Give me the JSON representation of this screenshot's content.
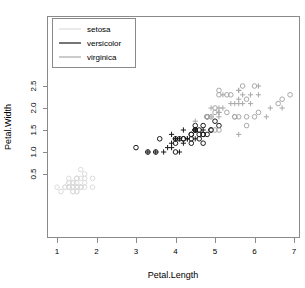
{
  "chart_data": {
    "type": "scatter",
    "title": "",
    "xlabel": "Petal.Length",
    "ylabel": "Petal.Width",
    "xlim": [
      0.8,
      7.05
    ],
    "ylim": [
      0.05,
      2.6
    ],
    "xticks": [
      1,
      2,
      3,
      4,
      5,
      6,
      7
    ],
    "yticks": [
      0.5,
      1.0,
      1.5,
      2.0,
      2.5
    ],
    "xticklabels": [
      "1",
      "2",
      "3",
      "4",
      "5",
      "6",
      "7"
    ],
    "yticklabels": [
      "0.5",
      "1.0",
      "1.5",
      "2.0",
      "2.5"
    ],
    "grid": false,
    "legend_position": "top-left",
    "legend": [
      {
        "label": "setosa",
        "color": "#d9d9d9",
        "marker": "circle"
      },
      {
        "label": "versicolor",
        "color": "#1a1a1a",
        "marker": "circle"
      },
      {
        "label": "virginica",
        "color": "#a8a8a8",
        "marker": "circle"
      }
    ],
    "series": [
      {
        "name": "setosa",
        "color": "#dcdcdc",
        "marker": "circle",
        "points": [
          [
            1.4,
            0.2
          ],
          [
            1.4,
            0.2
          ],
          [
            1.3,
            0.2
          ],
          [
            1.5,
            0.2
          ],
          [
            1.4,
            0.2
          ],
          [
            1.7,
            0.4
          ],
          [
            1.4,
            0.3
          ],
          [
            1.5,
            0.2
          ],
          [
            1.4,
            0.2
          ],
          [
            1.5,
            0.1
          ],
          [
            1.5,
            0.2
          ],
          [
            1.6,
            0.2
          ],
          [
            1.4,
            0.1
          ],
          [
            1.1,
            0.1
          ],
          [
            1.2,
            0.2
          ],
          [
            1.5,
            0.4
          ],
          [
            1.3,
            0.4
          ],
          [
            1.4,
            0.3
          ],
          [
            1.7,
            0.3
          ],
          [
            1.5,
            0.3
          ],
          [
            1.7,
            0.2
          ],
          [
            1.5,
            0.4
          ],
          [
            1.0,
            0.2
          ],
          [
            1.7,
            0.5
          ],
          [
            1.9,
            0.2
          ],
          [
            1.6,
            0.2
          ],
          [
            1.6,
            0.4
          ],
          [
            1.5,
            0.2
          ],
          [
            1.4,
            0.2
          ],
          [
            1.6,
            0.2
          ],
          [
            1.6,
            0.2
          ],
          [
            1.5,
            0.4
          ],
          [
            1.5,
            0.1
          ],
          [
            1.4,
            0.2
          ],
          [
            1.5,
            0.2
          ],
          [
            1.2,
            0.2
          ],
          [
            1.3,
            0.2
          ],
          [
            1.4,
            0.1
          ],
          [
            1.3,
            0.2
          ],
          [
            1.5,
            0.2
          ],
          [
            1.3,
            0.3
          ],
          [
            1.3,
            0.3
          ],
          [
            1.3,
            0.2
          ],
          [
            1.6,
            0.6
          ],
          [
            1.9,
            0.4
          ],
          [
            1.4,
            0.3
          ],
          [
            1.6,
            0.2
          ],
          [
            1.4,
            0.2
          ],
          [
            1.5,
            0.2
          ],
          [
            1.4,
            0.2
          ]
        ]
      },
      {
        "name": "versicolor",
        "color": "#1a1a1a",
        "marker": "mixed",
        "points": [
          [
            4.7,
            1.4
          ],
          [
            4.5,
            1.5
          ],
          [
            4.9,
            1.5
          ],
          [
            4.0,
            1.3
          ],
          [
            4.6,
            1.5
          ],
          [
            4.5,
            1.3
          ],
          [
            4.7,
            1.6
          ],
          [
            3.3,
            1.0
          ],
          [
            4.6,
            1.3
          ],
          [
            3.9,
            1.4
          ],
          [
            3.5,
            1.0
          ],
          [
            4.2,
            1.5
          ],
          [
            4.0,
            1.0
          ],
          [
            4.7,
            1.4
          ],
          [
            3.6,
            1.3
          ],
          [
            4.4,
            1.4
          ],
          [
            4.5,
            1.5
          ],
          [
            4.1,
            1.0
          ],
          [
            4.5,
            1.5
          ],
          [
            3.9,
            1.1
          ],
          [
            4.8,
            1.8
          ],
          [
            4.0,
            1.3
          ],
          [
            4.9,
            1.5
          ],
          [
            4.7,
            1.2
          ],
          [
            4.3,
            1.3
          ],
          [
            4.4,
            1.4
          ],
          [
            4.8,
            1.4
          ],
          [
            5.0,
            1.7
          ],
          [
            4.5,
            1.5
          ],
          [
            3.5,
            1.0
          ],
          [
            3.8,
            1.1
          ],
          [
            3.7,
            1.0
          ],
          [
            3.9,
            1.2
          ],
          [
            5.1,
            1.6
          ],
          [
            4.5,
            1.5
          ],
          [
            4.5,
            1.6
          ],
          [
            4.7,
            1.5
          ],
          [
            4.4,
            1.3
          ],
          [
            4.1,
            1.3
          ],
          [
            4.0,
            1.3
          ],
          [
            4.4,
            1.2
          ],
          [
            4.6,
            1.4
          ],
          [
            4.0,
            1.2
          ],
          [
            3.3,
            1.0
          ],
          [
            4.2,
            1.3
          ],
          [
            4.2,
            1.2
          ],
          [
            4.2,
            1.3
          ],
          [
            4.3,
            1.3
          ],
          [
            3.0,
            1.1
          ],
          [
            4.1,
            1.3
          ]
        ]
      },
      {
        "name": "virginica",
        "color": "#a8a8a8",
        "marker": "mixed",
        "points": [
          [
            6.0,
            2.5
          ],
          [
            5.1,
            1.9
          ],
          [
            5.9,
            2.1
          ],
          [
            5.6,
            1.8
          ],
          [
            5.8,
            2.2
          ],
          [
            6.6,
            2.1
          ],
          [
            4.5,
            1.7
          ],
          [
            6.3,
            1.8
          ],
          [
            5.8,
            1.8
          ],
          [
            6.1,
            2.5
          ],
          [
            5.1,
            2.0
          ],
          [
            5.3,
            1.9
          ],
          [
            5.5,
            2.1
          ],
          [
            5.0,
            2.0
          ],
          [
            5.1,
            2.4
          ],
          [
            5.3,
            2.3
          ],
          [
            5.5,
            1.8
          ],
          [
            6.7,
            2.2
          ],
          [
            6.9,
            2.3
          ],
          [
            5.0,
            1.5
          ],
          [
            5.7,
            2.3
          ],
          [
            4.9,
            2.0
          ],
          [
            6.7,
            2.0
          ],
          [
            4.9,
            1.8
          ],
          [
            5.7,
            2.1
          ],
          [
            6.0,
            1.8
          ],
          [
            4.8,
            1.8
          ],
          [
            4.9,
            1.8
          ],
          [
            5.6,
            2.1
          ],
          [
            5.8,
            1.6
          ],
          [
            6.1,
            1.9
          ],
          [
            6.4,
            2.0
          ],
          [
            5.6,
            2.2
          ],
          [
            5.1,
            1.5
          ],
          [
            5.6,
            1.4
          ],
          [
            6.1,
            2.3
          ],
          [
            5.6,
            2.4
          ],
          [
            5.5,
            1.8
          ],
          [
            4.8,
            1.8
          ],
          [
            5.4,
            2.1
          ],
          [
            5.6,
            2.4
          ],
          [
            5.1,
            2.3
          ],
          [
            5.1,
            1.9
          ],
          [
            5.9,
            2.3
          ],
          [
            5.7,
            2.5
          ],
          [
            5.2,
            2.3
          ],
          [
            5.0,
            1.9
          ],
          [
            5.2,
            2.0
          ],
          [
            5.4,
            2.3
          ],
          [
            5.1,
            1.8
          ]
        ]
      }
    ]
  },
  "axes": {
    "xlabel": "Petal.Length",
    "ylabel": "Petal.Width"
  },
  "legend": {
    "items": [
      {
        "label": "setosa"
      },
      {
        "label": "versicolor"
      },
      {
        "label": "virginica"
      }
    ]
  },
  "ticks": {
    "x": [
      "1",
      "2",
      "3",
      "4",
      "5",
      "6",
      "7"
    ],
    "y": [
      "0.5",
      "1.0",
      "1.5",
      "2.0",
      "2.5"
    ]
  }
}
